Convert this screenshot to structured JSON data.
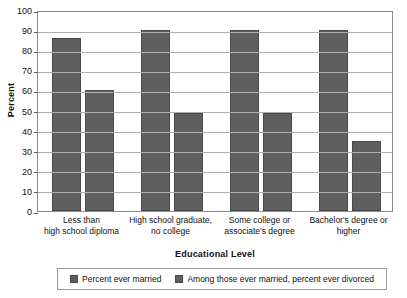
{
  "chart_data": {
    "type": "bar",
    "title": "",
    "xlabel": "Educational Level",
    "ylabel": "Percent",
    "ylim": [
      0,
      100
    ],
    "ytick_step": 10,
    "yticks": [
      100,
      90,
      80,
      70,
      60,
      50,
      40,
      30,
      20,
      10,
      0
    ],
    "grid": true,
    "legend_position": "bottom",
    "bar_color": "#5f5f5f",
    "categories": [
      "Less than\nhigh school diploma",
      "High school graduate,\nno college",
      "Some college or\nassociate's degree",
      "Bachelor's degree or\nhigher"
    ],
    "category_lines": [
      [
        "Less than",
        "high school diploma"
      ],
      [
        "High school graduate,",
        "no college"
      ],
      [
        "Some college or",
        "associate's degree"
      ],
      [
        "Bachelor's degree or",
        "higher"
      ]
    ],
    "series": [
      {
        "name": "Percent ever married",
        "values": [
          86,
          90,
          90,
          90
        ]
      },
      {
        "name": "Among those ever married, percent ever divorced",
        "values": [
          60,
          49,
          49,
          35
        ]
      }
    ]
  },
  "legend": {
    "items": [
      {
        "label": "Percent ever married"
      },
      {
        "label": "Among those ever married, percent ever divorced"
      }
    ]
  }
}
